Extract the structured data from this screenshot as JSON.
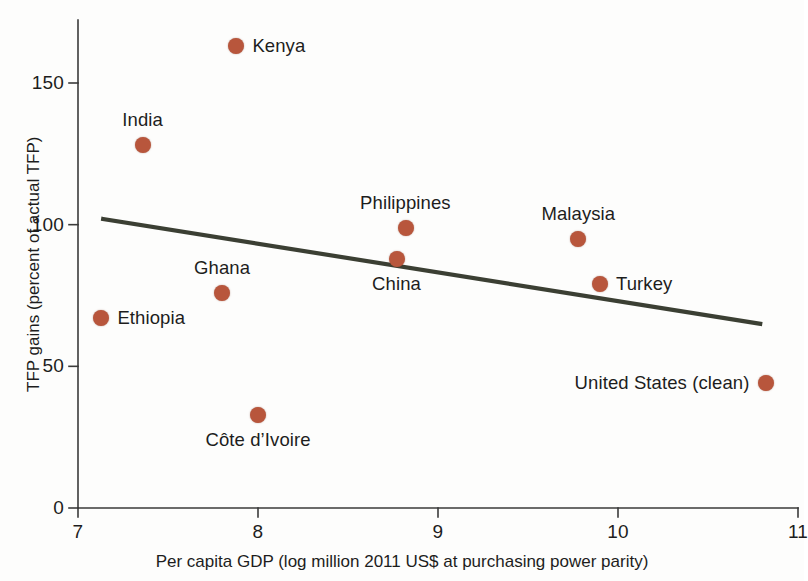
{
  "chart_data": {
    "type": "scatter",
    "title": "",
    "xlabel": "Per capita GDP (log million 2011 US$ at purchasing power parity)",
    "ylabel": "TFP gains (percent of actual TFP)",
    "xlim": [
      7,
      11
    ],
    "ylim": [
      0,
      175
    ],
    "xticks": [
      "7",
      "8",
      "9",
      "10",
      "11"
    ],
    "xtick_values": [
      7,
      8,
      9,
      10,
      11
    ],
    "yticks": [
      "0",
      "50",
      "100",
      "150"
    ],
    "ytick_values": [
      0,
      50,
      100,
      150
    ],
    "grid": false,
    "legend": "none",
    "marker_color": "#b8563c",
    "trendline_color": "#3b3f33",
    "axis_color": "#3a3a3a",
    "points": [
      {
        "name": "Kenya",
        "x": 7.88,
        "y": 163,
        "label_pos": "right"
      },
      {
        "name": "India",
        "x": 7.36,
        "y": 128,
        "label_pos": "above"
      },
      {
        "name": "Ethiopia",
        "x": 7.13,
        "y": 67,
        "label_pos": "right"
      },
      {
        "name": "Ghana",
        "x": 7.8,
        "y": 76,
        "label_pos": "above"
      },
      {
        "name": "Côte d’Ivoire",
        "x": 8.0,
        "y": 33,
        "label_pos": "below"
      },
      {
        "name": "China",
        "x": 8.77,
        "y": 88,
        "label_pos": "below"
      },
      {
        "name": "Philippines",
        "x": 8.82,
        "y": 99,
        "label_pos": "above"
      },
      {
        "name": "Malaysia",
        "x": 9.78,
        "y": 95,
        "label_pos": "above"
      },
      {
        "name": "Turkey",
        "x": 9.9,
        "y": 79,
        "label_pos": "right"
      },
      {
        "name": "United States (clean)",
        "x": 10.82,
        "y": 44,
        "label_pos": "left"
      }
    ],
    "trendline": {
      "x_start": 7.14,
      "y_start": 102,
      "x_end": 10.79,
      "y_end": 65
    }
  }
}
